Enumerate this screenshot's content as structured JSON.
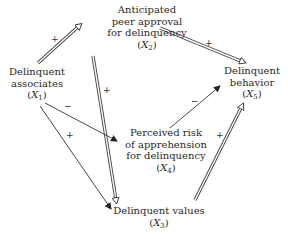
{
  "diagram": {
    "nodes": {
      "x1": {
        "lines": [
          "Delinquent",
          "associates"
        ],
        "var": "X",
        "sub": "1"
      },
      "x2": {
        "lines": [
          "Anticipated",
          "peer approval",
          "for delinquency"
        ],
        "var": "X",
        "sub": "2"
      },
      "x3": {
        "lines": [
          "Delinquent values"
        ],
        "var": "X",
        "sub": "3"
      },
      "x4": {
        "lines": [
          "Perceived risk",
          "of apprehension",
          "for delinquency"
        ],
        "var": "X",
        "sub": "4"
      },
      "x5": {
        "lines": [
          "Delinquent",
          "behavior"
        ],
        "var": "X",
        "sub": "5"
      }
    },
    "edges": [
      {
        "from": "X1",
        "to": "X2",
        "sign": "+",
        "style": "double"
      },
      {
        "from": "X2",
        "to": "X5",
        "sign": "+",
        "style": "double"
      },
      {
        "from": "X2",
        "to": "X3",
        "sign": "+",
        "style": "double"
      },
      {
        "from": "X1",
        "to": "X4",
        "sign": "−",
        "style": "single"
      },
      {
        "from": "X1",
        "to": "X3",
        "sign": "+",
        "style": "single"
      },
      {
        "from": "X4",
        "to": "X5",
        "sign": "−",
        "style": "single"
      },
      {
        "from": "X3",
        "to": "X5",
        "sign": "+",
        "style": "double"
      }
    ],
    "signs": {
      "x1_x2": "+",
      "x2_x5": "+",
      "x2_x3": "+",
      "x1_x4": "−",
      "x1_x3": "+",
      "x4_x5": "−",
      "x3_x5": "+"
    },
    "paren_open": "(",
    "paren_close": ")"
  }
}
